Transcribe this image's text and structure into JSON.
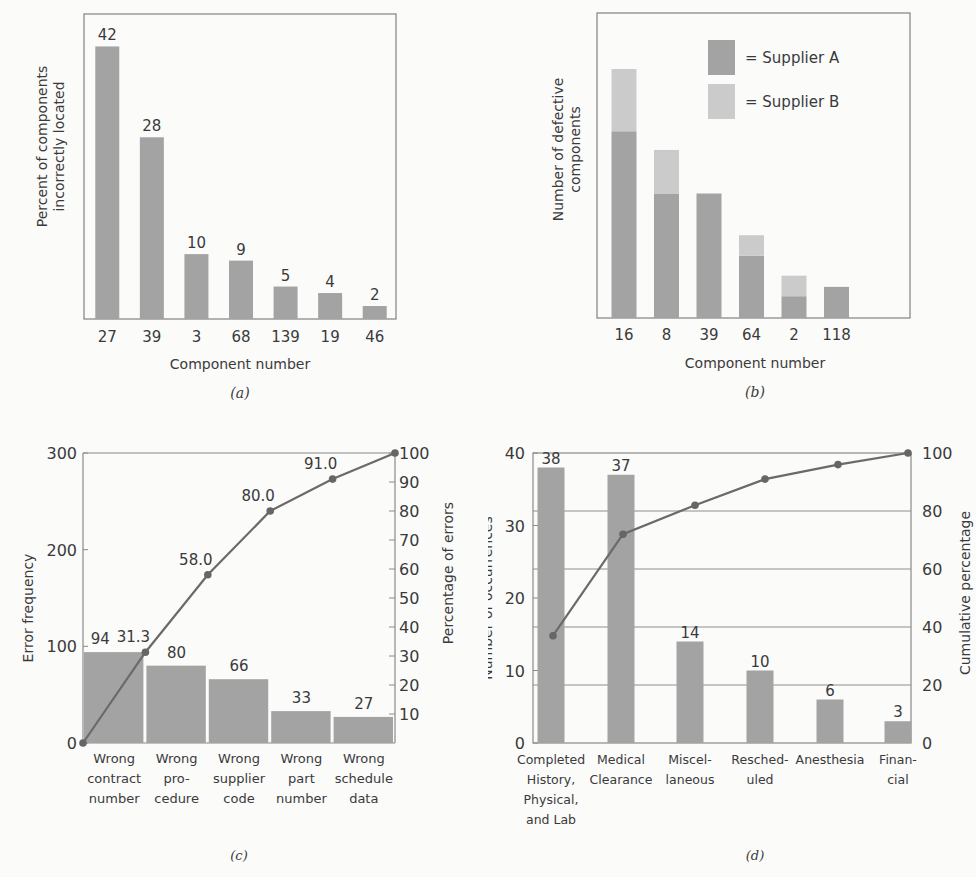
{
  "chart_data": [
    {
      "id": "a",
      "type": "bar",
      "caption": "(a)",
      "title": "",
      "xlabel": "Component number",
      "ylabel": "Percent of components incorrectly located",
      "ylabel_lines": [
        "Percent of components",
        "incorrectly located"
      ],
      "categories": [
        "27",
        "39",
        "3",
        "68",
        "139",
        "19",
        "46"
      ],
      "values": [
        42,
        28,
        10,
        9,
        5,
        4,
        2
      ],
      "data_labels": [
        "42",
        "28",
        "10",
        "9",
        "5",
        "4",
        "2"
      ],
      "ylim": [
        0,
        47
      ],
      "grid": false,
      "bar_color": "#a3a3a3"
    },
    {
      "id": "b",
      "type": "bar",
      "stacked": true,
      "caption": "(b)",
      "xlabel": "Component number",
      "ylabel": "Number of defective components",
      "ylabel_lines": [
        "Number of defective",
        "components"
      ],
      "categories": [
        "16",
        "8",
        "39",
        "64",
        "2",
        "118"
      ],
      "series": [
        {
          "name": "Supplier A",
          "legend_label": "= Supplier A",
          "color": "#a3a3a3",
          "values": [
            30,
            20,
            20,
            10,
            3.5,
            5
          ]
        },
        {
          "name": "Supplier B",
          "legend_label": "= Supplier B",
          "color": "#cbcbcb",
          "values": [
            10,
            7,
            0,
            3.3,
            3.3,
            0
          ]
        }
      ],
      "ylim": [
        0,
        49
      ],
      "legend_position": "upper right",
      "grid": false
    },
    {
      "id": "c",
      "type": "bar",
      "combo": "pareto",
      "caption": "(c)",
      "xlabel": "",
      "ylabel": "Error frequency",
      "y2label": "Percentage of errors",
      "categories": [
        "Wrong contract number",
        "Wrong procedure",
        "Wrong supplier code",
        "Wrong part number",
        "Wrong schedule data"
      ],
      "category_lines": [
        [
          "Wrong",
          "contract",
          "number"
        ],
        [
          "Wrong",
          "pro-",
          "cedure"
        ],
        [
          "Wrong",
          "supplier",
          "code"
        ],
        [
          "Wrong",
          "part",
          "number"
        ],
        [
          "Wrong",
          "schedule",
          "data"
        ]
      ],
      "values": [
        94,
        80,
        66,
        33,
        27
      ],
      "data_labels": [
        "94",
        "80",
        "66",
        "33",
        "27"
      ],
      "cumulative_percent": [
        0,
        31.3,
        58.0,
        80.0,
        91.0,
        100
      ],
      "cumulative_labels": [
        "",
        "31.3",
        "58.0",
        "80.0",
        "91.0",
        ""
      ],
      "ylim": [
        0,
        300
      ],
      "yticks": [
        "0",
        "100",
        "200",
        "300"
      ],
      "y2lim": [
        0,
        100
      ],
      "y2ticks": [
        "10",
        "20",
        "30",
        "40",
        "50",
        "60",
        "70",
        "80",
        "90",
        "100"
      ],
      "grid": false
    },
    {
      "id": "d",
      "type": "bar",
      "combo": "pareto",
      "caption": "(d)",
      "ylabel": "Number of occurrences",
      "y2label": "Cumulative percentage",
      "categories": [
        "Completed History, Physical, and Lab",
        "Medical Clearance",
        "Miscellaneous",
        "Rescheduled",
        "Anesthesia",
        "Financial"
      ],
      "category_lines": [
        [
          "Completed",
          "History,",
          "Physical,",
          "and Lab"
        ],
        [
          "Medical",
          "Clearance"
        ],
        [
          "Miscel-",
          "laneous"
        ],
        [
          "Resched-",
          "uled"
        ],
        [
          "Anesthesia"
        ],
        [
          "Finan-",
          "cial"
        ]
      ],
      "values": [
        38,
        37,
        14,
        10,
        6,
        3
      ],
      "data_labels": [
        "38",
        "37",
        "14",
        "10",
        "6",
        "3"
      ],
      "cumulative_percent": [
        37,
        72,
        82,
        91,
        96,
        100
      ],
      "ylim": [
        0,
        40
      ],
      "yticks": [
        "0",
        "10",
        "20",
        "30",
        "40"
      ],
      "y2lim": [
        0,
        100
      ],
      "y2ticks": [
        "0",
        "20",
        "40",
        "60",
        "80",
        "100"
      ],
      "grid": true
    }
  ]
}
